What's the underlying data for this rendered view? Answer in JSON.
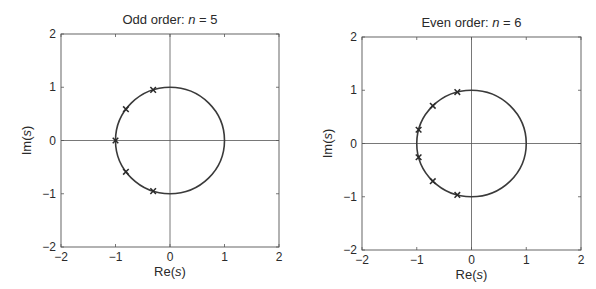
{
  "chart_data": [
    {
      "type": "scatter",
      "title": "Odd order: n = 5",
      "title_prefix": "Odd order: ",
      "title_var": "n",
      "title_suffix": " = 5",
      "xlabel": "Re(s)",
      "ylabel": "Im(s)",
      "xlim": [
        -2,
        2
      ],
      "ylim": [
        -2,
        2
      ],
      "xticks": [
        -2,
        -1,
        0,
        1,
        2
      ],
      "yticks": [
        -2,
        -1,
        0,
        1,
        2
      ],
      "grid": false,
      "axes_lines_through_origin": true,
      "unit_circle": {
        "center": [
          0,
          0
        ],
        "radius": 1
      },
      "series": [
        {
          "name": "poles",
          "marker": "x",
          "points": [
            {
              "re": -0.309,
              "im": 0.951
            },
            {
              "re": -0.809,
              "im": 0.588
            },
            {
              "re": -1.0,
              "im": 0.0
            },
            {
              "re": -0.809,
              "im": -0.588
            },
            {
              "re": -0.309,
              "im": -0.951
            }
          ]
        }
      ]
    },
    {
      "type": "scatter",
      "title": "Even order: n = 6",
      "title_prefix": "Even order: ",
      "title_var": "n",
      "title_suffix": " = 6",
      "xlabel": "Re(s)",
      "ylabel": "Im(s)",
      "xlim": [
        -2,
        2
      ],
      "ylim": [
        -2,
        2
      ],
      "xticks": [
        -2,
        -1,
        0,
        1,
        2
      ],
      "yticks": [
        -2,
        -1,
        0,
        1,
        2
      ],
      "grid": false,
      "axes_lines_through_origin": true,
      "unit_circle": {
        "center": [
          0,
          0
        ],
        "radius": 1
      },
      "series": [
        {
          "name": "poles",
          "marker": "x",
          "points": [
            {
              "re": -0.259,
              "im": 0.966
            },
            {
              "re": -0.707,
              "im": 0.707
            },
            {
              "re": -0.966,
              "im": 0.259
            },
            {
              "re": -0.966,
              "im": -0.259
            },
            {
              "re": -0.707,
              "im": -0.707
            },
            {
              "re": -0.259,
              "im": -0.966
            }
          ]
        }
      ]
    }
  ],
  "style": {
    "frame_color": "#555555",
    "axis_line_color": "#555555",
    "curve_color": "#3a3a3a",
    "marker_color": "#2a2a2a",
    "background": "#ffffff"
  }
}
